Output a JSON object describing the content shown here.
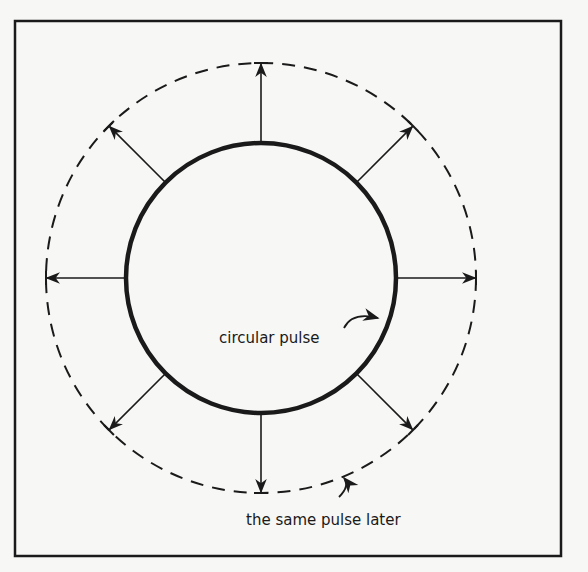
{
  "diagram": {
    "type": "wave-propagation",
    "labels": {
      "inner": "circular pulse",
      "outer": "the same pulse later"
    },
    "geometry": {
      "center": [
        261,
        278
      ],
      "inner_radius": 135,
      "outer_radius": 215,
      "frame": {
        "x": 15,
        "y": 21,
        "width": 546,
        "height": 535
      },
      "arrow_angles_deg": [
        0,
        45,
        90,
        135,
        180,
        225,
        270,
        315
      ]
    },
    "colors": {
      "ink": "#1a1a1a",
      "paper": "#f7f7f5"
    }
  }
}
